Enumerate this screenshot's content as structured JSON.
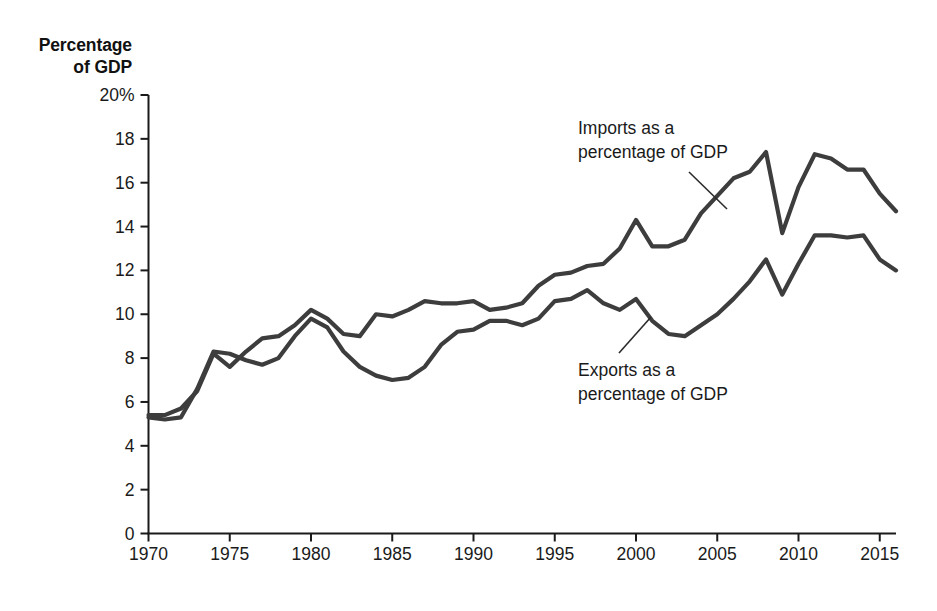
{
  "chart_data": {
    "type": "line",
    "title": "",
    "ylabel": "Percentage of GDP",
    "xlabel": "",
    "xlim": [
      1970,
      2016
    ],
    "ylim": [
      0,
      20
    ],
    "grid": false,
    "legend_position": "inline-annotations",
    "y_ticks": [
      "0",
      "2",
      "4",
      "6",
      "8",
      "10",
      "12",
      "14",
      "16",
      "18",
      "20%"
    ],
    "y_tick_values": [
      0,
      2,
      4,
      6,
      8,
      10,
      12,
      14,
      16,
      18,
      20
    ],
    "x_ticks": [
      "1970",
      "1975",
      "1980",
      "1985",
      "1990",
      "1995",
      "2000",
      "2005",
      "2010",
      "2015"
    ],
    "x_tick_values": [
      1970,
      1975,
      1980,
      1985,
      1990,
      1995,
      2000,
      2005,
      2010,
      2015
    ],
    "x": [
      1970,
      1971,
      1972,
      1973,
      1974,
      1975,
      1976,
      1977,
      1978,
      1979,
      1980,
      1981,
      1982,
      1983,
      1984,
      1985,
      1986,
      1987,
      1988,
      1989,
      1990,
      1991,
      1992,
      1993,
      1994,
      1995,
      1996,
      1997,
      1998,
      1999,
      2000,
      2001,
      2002,
      2003,
      2004,
      2005,
      2006,
      2007,
      2008,
      2009,
      2010,
      2011,
      2012,
      2013,
      2014,
      2015,
      2016
    ],
    "series": [
      {
        "name": "Imports as a percentage of GDP",
        "color": "#3d3d3d",
        "values": [
          5.4,
          5.4,
          5.7,
          6.5,
          8.2,
          7.6,
          8.3,
          8.9,
          9.0,
          9.5,
          10.2,
          9.8,
          9.1,
          9.0,
          10.0,
          9.9,
          10.2,
          10.6,
          10.5,
          10.5,
          10.6,
          10.2,
          10.3,
          10.5,
          11.3,
          11.8,
          11.9,
          12.2,
          12.3,
          13.0,
          14.3,
          13.1,
          13.1,
          13.4,
          14.6,
          15.4,
          16.2,
          16.5,
          17.4,
          13.7,
          15.8,
          17.3,
          17.1,
          16.6,
          16.6,
          15.5,
          14.7
        ]
      },
      {
        "name": "Exports as a percentage of GDP",
        "color": "#3d3d3d",
        "values": [
          5.3,
          5.2,
          5.3,
          6.6,
          8.3,
          8.2,
          7.9,
          7.7,
          8.0,
          9.0,
          9.8,
          9.4,
          8.3,
          7.6,
          7.2,
          7.0,
          7.1,
          7.6,
          8.6,
          9.2,
          9.3,
          9.7,
          9.7,
          9.5,
          9.8,
          10.6,
          10.7,
          11.1,
          10.5,
          10.2,
          10.7,
          9.7,
          9.1,
          9.0,
          9.5,
          10.0,
          10.7,
          11.5,
          12.5,
          10.9,
          12.3,
          13.6,
          13.6,
          13.5,
          13.6,
          12.5,
          12.0
        ]
      }
    ]
  },
  "axis_title": {
    "line1": "Percentage",
    "line2": "of GDP"
  },
  "annotations": {
    "imports": {
      "line1": "Imports as a",
      "line2": "percentage of GDP"
    },
    "exports": {
      "line1": "Exports as a",
      "line2": "percentage of GDP"
    }
  },
  "colors": {
    "line": "#3d3d3d",
    "axis": "#1a1a1a",
    "text": "#1a1a1a",
    "background": "#ffffff"
  }
}
